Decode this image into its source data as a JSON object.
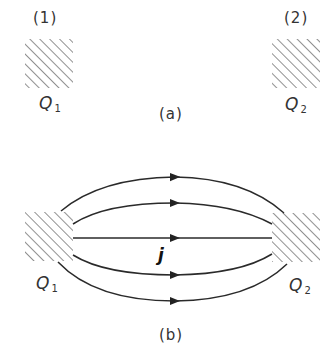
{
  "part_a": {
    "caption": "(a)",
    "region1": {
      "index_label": "(1)",
      "charge_symbol": "Q",
      "charge_subscript": "1"
    },
    "region2": {
      "index_label": "(2)",
      "charge_symbol": "Q",
      "charge_subscript": "2"
    }
  },
  "part_b": {
    "caption": "(b)",
    "current_label": "j",
    "region1": {
      "charge_symbol": "Q",
      "charge_subscript": "1"
    },
    "region2": {
      "charge_symbol": "Q",
      "charge_subscript": "2"
    },
    "flow_lines": [
      {
        "id": "line-1",
        "direction": "left-to-right"
      },
      {
        "id": "line-2",
        "direction": "left-to-right"
      },
      {
        "id": "line-3",
        "direction": "left-to-right"
      },
      {
        "id": "line-4",
        "direction": "left-to-right"
      },
      {
        "id": "line-5",
        "direction": "left-to-right"
      }
    ]
  },
  "colors": {
    "line": "#2a2a2a",
    "hatch": "#555555",
    "background": "#ffffff"
  }
}
